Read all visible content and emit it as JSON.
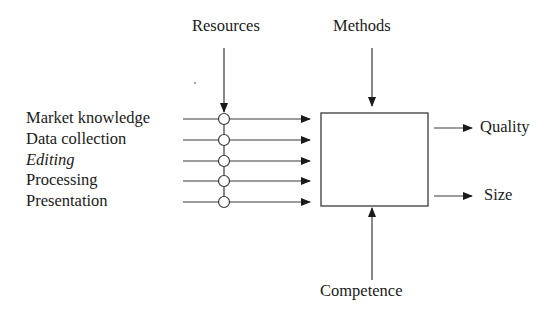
{
  "diagram": {
    "top_labels": {
      "resources": "Resources",
      "methods": "Methods"
    },
    "inputs": [
      {
        "label": "Market knowledge",
        "italic": false
      },
      {
        "label": "Data collection",
        "italic": false
      },
      {
        "label": "Editing",
        "italic": true
      },
      {
        "label": "Processing",
        "italic": false
      },
      {
        "label": "Presentation",
        "italic": false
      }
    ],
    "outputs": [
      {
        "label": "Quality"
      },
      {
        "label": "Size"
      }
    ],
    "bottom_label": "Competence",
    "colors": {
      "line": "#3a3a3a",
      "text": "#1a1a1a",
      "background": "#ffffff"
    }
  }
}
